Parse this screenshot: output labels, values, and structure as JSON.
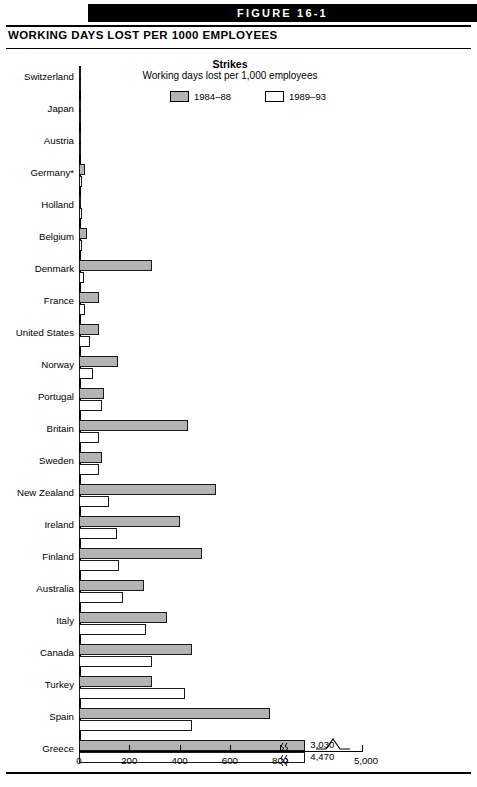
{
  "figure": {
    "banner_label": "FIGURE 16-1",
    "title": "WORKING DAYS LOST PER 1000 EMPLOYEES"
  },
  "chart_data": {
    "type": "bar",
    "orientation": "horizontal",
    "title": "Strikes",
    "subtitle": "Working days lost per 1,000 employees",
    "xlabel": "",
    "ylabel": "",
    "xlim": [
      0,
      900
    ],
    "xticks": [
      0,
      200,
      400,
      600,
      800,
      5000
    ],
    "xtick_labels": [
      "0",
      "200",
      "400",
      "600",
      "800",
      "5,000"
    ],
    "axis_break": true,
    "grid": false,
    "legend_position": "top",
    "series": [
      {
        "name": "1984–88",
        "color": "#b3b3b3"
      },
      {
        "name": "1989–93",
        "color": "#ffffff"
      }
    ],
    "categories": [
      "Switzerland",
      "Japan",
      "Austria",
      "Germany*",
      "Holland",
      "Belgium",
      "Denmark",
      "France",
      "United States",
      "Norway",
      "Portugal",
      "Britain",
      "Sweden",
      "New Zealand",
      "Ireland",
      "Finland",
      "Australia",
      "Italy",
      "Canada",
      "Turkey",
      "Spain",
      "Greece"
    ],
    "values_1984_88": [
      2,
      5,
      2,
      25,
      9,
      30,
      290,
      80,
      80,
      155,
      100,
      435,
      90,
      545,
      400,
      490,
      260,
      350,
      450,
      290,
      760,
      3030
    ],
    "values_1989_93": [
      1,
      2,
      6,
      11,
      12,
      12,
      18,
      25,
      45,
      55,
      90,
      80,
      80,
      120,
      150,
      160,
      175,
      265,
      290,
      420,
      450,
      4470
    ],
    "annotations": [
      {
        "category": "Greece",
        "series": "1984–88",
        "label": "3,030"
      },
      {
        "category": "Greece",
        "series": "1989–93",
        "label": "4,470"
      }
    ]
  }
}
